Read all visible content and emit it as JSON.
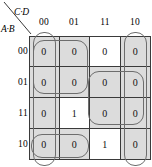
{
  "diagram": {
    "type": "karnaugh-map",
    "column_axis_label": "C·D",
    "row_axis_label": "A·B",
    "column_headers": [
      "00",
      "01",
      "11",
      "10"
    ],
    "row_headers": [
      "00",
      "01",
      "11",
      "10"
    ],
    "cells": [
      {
        "row": "00",
        "values": [
          "0",
          "0",
          "0",
          "0"
        ]
      },
      {
        "row": "01",
        "values": [
          "0",
          "0",
          "0",
          "0"
        ]
      },
      {
        "row": "11",
        "values": [
          "0",
          "1",
          "0",
          "0"
        ]
      },
      {
        "row": "10",
        "values": [
          "0",
          "0",
          "1",
          "0"
        ]
      }
    ],
    "shading": [
      [
        true,
        true,
        false,
        true
      ],
      [
        true,
        true,
        true,
        true
      ],
      [
        true,
        false,
        true,
        true
      ],
      [
        true,
        true,
        false,
        true
      ]
    ],
    "groups": [
      {
        "name": "group-top-left-2x2",
        "row_span": [
          "00",
          "01"
        ],
        "col_span": [
          "00",
          "01"
        ]
      },
      {
        "name": "group-col-00-wrap",
        "row_span": [
          "00",
          "01",
          "11",
          "10"
        ],
        "col_span": [
          "00"
        ]
      },
      {
        "name": "group-col-10-wrap",
        "row_span": [
          "00",
          "01",
          "11",
          "10"
        ],
        "col_span": [
          "10"
        ]
      },
      {
        "name": "group-mid-right-2x2",
        "row_span": [
          "01",
          "11"
        ],
        "col_span": [
          "11",
          "10"
        ]
      },
      {
        "name": "group-bottom-left-pair",
        "row_span": [
          "10"
        ],
        "col_span": [
          "00",
          "01"
        ]
      }
    ],
    "colors": {
      "grid_line": "#3a3a3a",
      "loop_line": "#6d6d6d",
      "cell_shaded": "#dcdcdc",
      "cell_plain": "#ffffff",
      "text": "#111111"
    }
  }
}
